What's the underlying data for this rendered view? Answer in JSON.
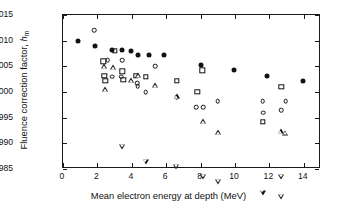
{
  "chart_data": {
    "type": "scatter",
    "title": "",
    "xlabel": "Mean electron energy at depth (MeV)",
    "ylabel": "Fluence correction factor, hₘ",
    "ylabel_parts": {
      "main": "Fluence correction factor, ",
      "symbol": "h",
      "subscript": "m"
    },
    "xlim": [
      0,
      15
    ],
    "ylim": [
      0.985,
      1.015
    ],
    "xticks": [
      0,
      2,
      4,
      6,
      8,
      10,
      12,
      14
    ],
    "xticklabels": [
      "0",
      "2",
      "4",
      "6",
      "8",
      "10",
      "12",
      "14"
    ],
    "yticks": [
      0.985,
      0.99,
      0.995,
      1.0,
      1.005,
      1.01,
      1.015
    ],
    "yticklabels": [
      "0.985",
      "0.990",
      "0.995",
      "1.000",
      "1.005",
      "1.010",
      "1.015"
    ],
    "grid": false,
    "legend": "none",
    "marker_color": "#121212",
    "series": [
      {
        "name": "filled-circle",
        "marker": "filled-circle",
        "points": [
          {
            "x": 0.9,
            "y": 1.01
          },
          {
            "x": 1.85,
            "y": 1.009
          },
          {
            "x": 2.85,
            "y": 1.0081
          },
          {
            "x": 3.45,
            "y": 1.0081
          },
          {
            "x": 3.95,
            "y": 1.008
          },
          {
            "x": 4.35,
            "y": 1.0072
          },
          {
            "x": 5.0,
            "y": 1.0072
          },
          {
            "x": 5.9,
            "y": 1.0072
          },
          {
            "x": 8.0,
            "y": 1.0052
          },
          {
            "x": 9.95,
            "y": 1.0042
          },
          {
            "x": 11.85,
            "y": 1.0032
          },
          {
            "x": 13.95,
            "y": 1.0022
          }
        ]
      },
      {
        "name": "open-circle",
        "marker": "open-circle",
        "points": [
          {
            "x": 1.8,
            "y": 1.012
          },
          {
            "x": 2.6,
            "y": 1.0062
          },
          {
            "x": 2.85,
            "y": 1.003
          },
          {
            "x": 3.4,
            "y": 1.003
          },
          {
            "x": 3.45,
            "y": 1.0062
          },
          {
            "x": 4.3,
            "y": 1.0017
          },
          {
            "x": 4.35,
            "y": 1.0011
          },
          {
            "x": 4.8,
            "y": 1.0
          },
          {
            "x": 5.35,
            "y": 1.005
          },
          {
            "x": 6.6,
            "y": 0.999
          },
          {
            "x": 7.75,
            "y": 0.997
          },
          {
            "x": 8.15,
            "y": 0.997
          },
          {
            "x": 9.0,
            "y": 0.9982
          },
          {
            "x": 11.6,
            "y": 0.9982
          },
          {
            "x": 11.65,
            "y": 0.996
          },
          {
            "x": 12.7,
            "y": 0.9964
          },
          {
            "x": 12.95,
            "y": 0.9982
          }
        ]
      },
      {
        "name": "open-square",
        "marker": "open-square",
        "points": [
          {
            "x": 2.35,
            "y": 1.006
          },
          {
            "x": 2.4,
            "y": 1.0031
          },
          {
            "x": 2.45,
            "y": 1.0022
          },
          {
            "x": 3.0,
            "y": 1.008
          },
          {
            "x": 3.45,
            "y": 1.004
          },
          {
            "x": 3.5,
            "y": 1.0024
          },
          {
            "x": 4.25,
            "y": 1.0031
          },
          {
            "x": 4.8,
            "y": 1.003
          },
          {
            "x": 6.6,
            "y": 1.0022
          },
          {
            "x": 7.8,
            "y": 1.0
          },
          {
            "x": 8.1,
            "y": 1.0042
          },
          {
            "x": 11.6,
            "y": 0.9942
          },
          {
            "x": 12.7,
            "y": 1.001
          }
        ]
      },
      {
        "name": "open-triangle-up",
        "marker": "open-triangle-up",
        "points": [
          {
            "x": 2.4,
            "y": 1.005
          },
          {
            "x": 2.45,
            "y": 1.0015
          },
          {
            "x": 2.9,
            "y": 1.0068
          },
          {
            "x": 3.95,
            "y": 1.0052
          },
          {
            "x": 4.35,
            "y": 1.0072
          },
          {
            "x": 5.35,
            "y": 1.0062
          },
          {
            "x": 6.6,
            "y": 1.005
          },
          {
            "x": 8.15,
            "y": 1.0012
          },
          {
            "x": 9.0,
            "y": 1.0
          },
          {
            "x": 12.65,
            "y": 1.0012
          },
          {
            "x": 12.9,
            "y": 1.0018
          }
        ]
      },
      {
        "name": "open-triangle-down",
        "marker": "open-triangle-down",
        "points": [
          {
            "x": 3.45,
            "y": 1.0
          },
          {
            "x": 4.8,
            "y": 0.998
          },
          {
            "x": 6.55,
            "y": 0.998
          },
          {
            "x": 8.15,
            "y": 0.997
          },
          {
            "x": 9.0,
            "y": 0.997
          },
          {
            "x": 11.6,
            "y": 0.996
          },
          {
            "x": 12.7,
            "y": 1.0
          },
          {
            "x": 12.7,
            "y": 0.997
          }
        ]
      }
    ]
  }
}
